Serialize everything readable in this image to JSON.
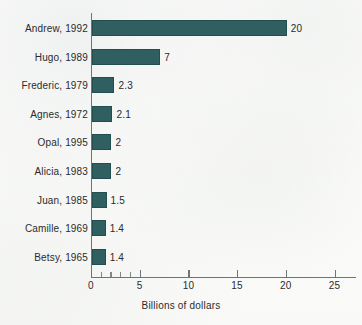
{
  "chart_data": {
    "type": "bar",
    "orientation": "horizontal",
    "title": "",
    "xlabel": "Billions of dollars",
    "ylabel": "",
    "categories": [
      "Andrew, 1992",
      "Hugo, 1989",
      "Frederic, 1979",
      "Agnes, 1972",
      "Opal, 1995",
      "Alicia, 1983",
      "Juan, 1985",
      "Camille, 1969",
      "Betsy, 1965"
    ],
    "values": [
      20,
      7,
      2.3,
      2.1,
      2,
      2,
      1.5,
      1.4,
      1.4
    ],
    "value_labels": [
      "20",
      "7",
      "2.3",
      "2.1",
      "2",
      "2",
      "1.5",
      "1.4",
      "1.4"
    ],
    "xlim": [
      0,
      27.2
    ],
    "xticks": [
      0,
      5,
      10,
      15,
      20,
      25
    ],
    "xtick_labels": [
      "0",
      "5",
      "10",
      "15",
      "20",
      "25"
    ],
    "xticks_minor": [
      1,
      2,
      3,
      4
    ],
    "grid": false,
    "legend": false,
    "bar_color": "#2f5f60",
    "bar_edge_color": "#244d4e",
    "axis_color": "#6e7574",
    "text_color": "#2b2b2b",
    "background_color": "#fbfbf9"
  }
}
